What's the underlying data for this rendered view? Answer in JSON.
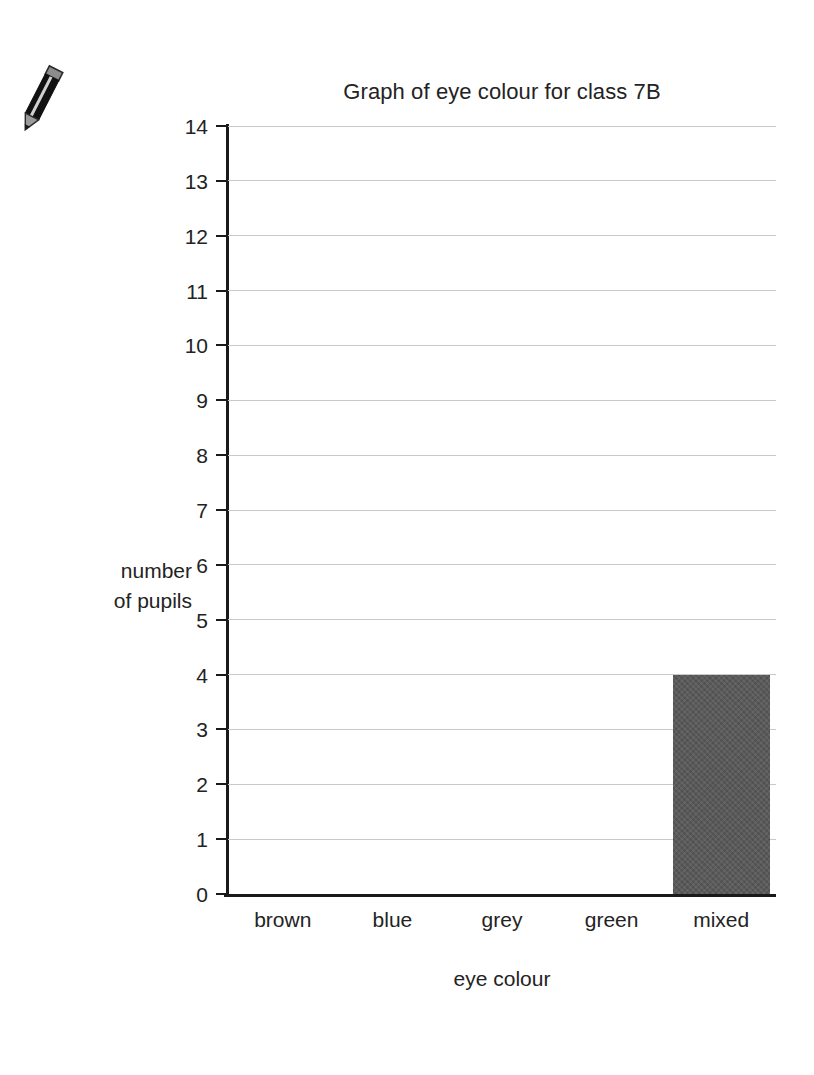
{
  "doodle": {
    "icon": "pencil-icon"
  },
  "chart_data": {
    "type": "bar",
    "title": "Graph of eye colour for class 7B",
    "xlabel": "eye colour",
    "ylabel_line1": "number",
    "ylabel_line2": "of pupils",
    "categories": [
      "brown",
      "blue",
      "grey",
      "green",
      "mixed"
    ],
    "values": [
      0,
      0,
      0,
      0,
      4
    ],
    "ylim": [
      0,
      14
    ],
    "ytick_step": 1,
    "yticks": [
      "14",
      "13",
      "12",
      "11",
      "10",
      "9",
      "8",
      "7",
      "6",
      "5",
      "4",
      "3",
      "2",
      "1",
      "0"
    ],
    "grid": true,
    "legend": "none",
    "bar_color": "#585858",
    "gridline_color": "#c9c9c9",
    "axis_color": "#1a1a1a",
    "background_color": "#ffffff"
  }
}
